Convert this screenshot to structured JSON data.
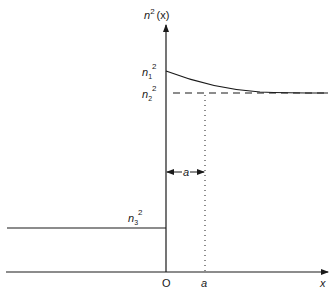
{
  "diagram": {
    "y_axis_label": {
      "base": "n",
      "sup": "2",
      "rest": "(x)"
    },
    "x_axis_label": "x",
    "origin_label": "O",
    "a_tick_label": "a",
    "width_annotation": "a",
    "levels": {
      "n1": {
        "base": "n",
        "sub": "1",
        "sup": "2"
      },
      "n2": {
        "base": "n",
        "sub": "2",
        "sup": "2"
      },
      "n3": {
        "base": "n",
        "sub": "3",
        "sup": "2"
      }
    },
    "colors": {
      "ink": "#1a1a1a",
      "background": "#ffffff"
    }
  }
}
